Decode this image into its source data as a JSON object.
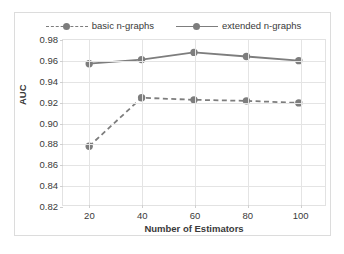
{
  "chart_data": {
    "type": "line",
    "title": "",
    "xlabel": "Number of Estimators",
    "ylabel": "AUC",
    "categories": [
      20,
      40,
      60,
      80,
      100
    ],
    "x": [
      20,
      40,
      60,
      80,
      100
    ],
    "xlim": [
      10,
      110
    ],
    "ylim": [
      0.82,
      0.98
    ],
    "xticks": [
      "20",
      "40",
      "60",
      "80",
      "100"
    ],
    "yticks": [
      "0.98",
      "0.96",
      "0.94",
      "0.92",
      "0.90",
      "0.88",
      "0.86",
      "0.84",
      "0.82"
    ],
    "grid": "both",
    "legend_position": "top-center",
    "series": [
      {
        "name": "basic n-graphs",
        "style": "dashed",
        "marker": "circle",
        "color": "#7d7d7d",
        "values": [
          0.877,
          0.924,
          0.922,
          0.921,
          0.919
        ]
      },
      {
        "name": "extended n-graphs",
        "style": "solid",
        "marker": "circle",
        "color": "#7d7d7d",
        "values": [
          0.957,
          0.961,
          0.968,
          0.964,
          0.96
        ]
      }
    ]
  },
  "colors": {
    "series": "#7d7d7d",
    "grid": "#e4e4e4",
    "plot_border": "#e2e2e2",
    "figure_border": "#dcdcdc",
    "text": "#3a3a3a",
    "background": "#ffffff"
  }
}
